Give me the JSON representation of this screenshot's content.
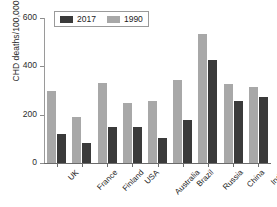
{
  "chart_data": {
    "type": "bar",
    "title": "",
    "xlabel": "",
    "ylabel": "CHD deaths/100,000",
    "ylim": [
      0,
      600
    ],
    "yticks": [
      0,
      200,
      400,
      600
    ],
    "grid": false,
    "legend_position": "top-left",
    "categories": [
      "UK",
      "France",
      "Finland",
      "USA",
      "Australia",
      "Brazil",
      "Russia",
      "China",
      "India"
    ],
    "series": [
      {
        "name": "1990",
        "color": "#a8a8a8",
        "values": [
          297,
          190,
          333,
          250,
          258,
          343,
          535,
          327,
          313
        ]
      },
      {
        "name": "2017",
        "color": "#3a3a3a",
        "values": [
          120,
          83,
          151,
          148,
          103,
          177,
          427,
          255,
          275
        ]
      }
    ]
  },
  "legend": {
    "entries": [
      {
        "label": "2017",
        "color": "#3a3a3a"
      },
      {
        "label": "1990",
        "color": "#a8a8a8"
      }
    ]
  }
}
